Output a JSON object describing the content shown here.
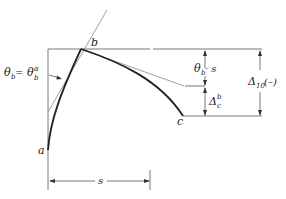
{
  "diagram": {
    "points": {
      "a": "a",
      "b": "b",
      "c": "c"
    },
    "labels": {
      "theta_main": "θ",
      "theta_sub": "b",
      "equals": " = ",
      "theta_alpha": "θ",
      "theta_alpha_sup": "α",
      "theta_alpha_sub": "b",
      "theta_s_theta": "θ",
      "theta_s_sub": "b",
      "theta_s_rest": " · s",
      "delta_c": "Δ",
      "delta_c_sup": "b",
      "delta_c_sub": "c",
      "delta_10": "Δ",
      "delta_10_sub": "10",
      "delta_10_sign": " (–)",
      "span_s": "s"
    }
  }
}
